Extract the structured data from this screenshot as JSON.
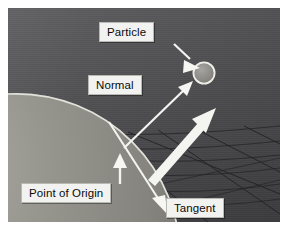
{
  "figure": {
    "kind": "3d-rendered-diagram",
    "description_labels": [
      "Particle",
      "Normal",
      "Point of Origin",
      "Tangent"
    ],
    "page_background": "#ffffff",
    "scene_background": "#555457"
  },
  "labels": {
    "particle": "Particle",
    "normal": "Normal",
    "point_of_origin": "Point of Origin",
    "tangent": "Tangent"
  },
  "colors": {
    "label_fill": "#f2f2f0",
    "label_text": "#0b0b0b",
    "label_border": "#b9b9b4",
    "arrow_white": "#f4f4f2",
    "sphere_fill": "#8d8c8a",
    "sphere_rim": "#ededea",
    "particle_fill": "#8b8a88",
    "particle_rim": "#efefec",
    "mesh_line": "#2a2a2c",
    "backdrop_dark": "#434245",
    "backdrop_light": "#5b5a5d"
  },
  "geometry": {
    "particle": {
      "cx": 196,
      "cy": 65,
      "r": 11
    },
    "origin_point": {
      "x": 116,
      "y": 140
    },
    "sphere": {
      "cx": 8,
      "cy": 250,
      "r": 165
    }
  },
  "vectors": [
    {
      "name": "normal",
      "from": [
        116,
        140
      ],
      "to": [
        182,
        77
      ],
      "style": "thin-arrow"
    },
    {
      "name": "tangent",
      "from": [
        101,
        116
      ],
      "to": [
        158,
        205
      ],
      "style": "thin-arrow"
    },
    {
      "name": "velocity",
      "from": [
        142,
        168
      ],
      "to": [
        204,
        105
      ],
      "style": "thick-arrow"
    },
    {
      "name": "particle-callout",
      "from": [
        168,
        39
      ],
      "to": [
        190,
        58
      ],
      "style": "thin-arrow"
    },
    {
      "name": "origin-callout",
      "from": [
        113,
        175
      ],
      "to": [
        113,
        151
      ],
      "style": "thin-arrow"
    }
  ]
}
